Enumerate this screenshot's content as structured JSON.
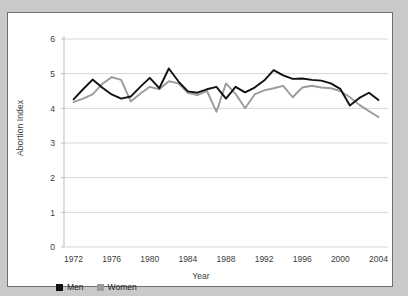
{
  "figure": {
    "background_color": "#c9c9c9",
    "panel_color": "#ffffff",
    "border_color": "#6f6f6f"
  },
  "legend": {
    "position": "bottom-left",
    "entries": [
      {
        "label": "Men",
        "color": "#111111",
        "swatch": "men-swatch"
      },
      {
        "label": "Women",
        "color": "#9b9b9b",
        "swatch": "women-swatch"
      }
    ]
  },
  "chart_data": {
    "type": "line",
    "title": "",
    "xlabel": "Year",
    "ylabel": "Abortion Index",
    "xlim": [
      1971,
      2005
    ],
    "ylim": [
      0,
      6
    ],
    "yticks": [
      0,
      1,
      2,
      3,
      4,
      5,
      6
    ],
    "ytick_labels": [
      "0",
      "1",
      "2",
      "3",
      "4",
      "5",
      "6"
    ],
    "xticks": [
      1972,
      1976,
      1980,
      1984,
      1988,
      1992,
      1996,
      2000,
      2004
    ],
    "xtick_labels": [
      "1972",
      "1976",
      "1980",
      "1984",
      "1988",
      "1992",
      "1996",
      "2000",
      "2004"
    ],
    "grid": "horizontal",
    "grid_color": "#d5d5d5",
    "legend_position": "below-axes-left",
    "x": [
      1972,
      1973,
      1974,
      1975,
      1976,
      1977,
      1978,
      1979,
      1980,
      1981,
      1982,
      1983,
      1984,
      1985,
      1986,
      1987,
      1988,
      1989,
      1990,
      1991,
      1992,
      1993,
      1994,
      1995,
      1996,
      1997,
      1998,
      1999,
      2000,
      2001,
      2002,
      2003,
      2004
    ],
    "series": [
      {
        "name": "Men",
        "color": "#111111",
        "values": [
          4.26,
          4.55,
          4.83,
          4.6,
          4.4,
          4.28,
          4.34,
          4.62,
          4.88,
          4.58,
          5.15,
          4.78,
          4.49,
          4.45,
          4.55,
          4.62,
          4.28,
          4.62,
          4.46,
          4.6,
          4.8,
          5.1,
          4.95,
          4.85,
          4.86,
          4.82,
          4.8,
          4.72,
          4.56,
          4.08,
          4.3,
          4.45,
          4.24
        ]
      },
      {
        "name": "Women",
        "color": "#9b9b9b",
        "values": [
          4.18,
          4.28,
          4.4,
          4.7,
          4.9,
          4.82,
          4.2,
          4.42,
          4.62,
          4.55,
          4.78,
          4.72,
          4.45,
          4.38,
          4.5,
          3.9,
          4.72,
          4.42,
          4.0,
          4.4,
          4.52,
          4.58,
          4.65,
          4.32,
          4.6,
          4.65,
          4.6,
          4.58,
          4.5,
          4.32,
          4.1,
          3.92,
          3.75
        ]
      }
    ]
  }
}
